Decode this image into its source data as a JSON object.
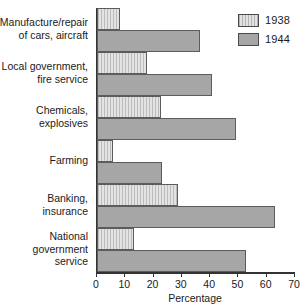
{
  "chart_data": {
    "type": "bar",
    "orientation": "horizontal",
    "title": "",
    "xlabel": "Percentage",
    "ylabel": "",
    "xlim": [
      0,
      70
    ],
    "xticks": [
      0,
      10,
      20,
      30,
      40,
      50,
      60,
      70
    ],
    "grid": false,
    "legend_position": "top-right",
    "categories": [
      "Manufacture/repair of cars, aircraft",
      "Local government, fire service",
      "Chemicals, explosives",
      "Farming",
      "Banking, insurance",
      "National government service"
    ],
    "series": [
      {
        "name": "1938",
        "color": "#e3e3e3",
        "values": [
          8,
          17.5,
          22.5,
          5.5,
          28.5,
          13
        ]
      },
      {
        "name": "1944",
        "color": "#a6a6a6",
        "values": [
          36.5,
          40.5,
          49,
          23,
          63,
          52.5
        ]
      }
    ]
  },
  "legend": {
    "items": [
      {
        "label": "1938",
        "swatch": "light-hatched-swatch"
      },
      {
        "label": "1944",
        "swatch": "dark-gray-swatch"
      }
    ]
  },
  "axis": {
    "x_title": "Percentage",
    "x_tick_labels": [
      "0",
      "10",
      "20",
      "30",
      "40",
      "50",
      "60",
      "70"
    ]
  },
  "category_labels": [
    {
      "line1": "Manufacture/repair",
      "line2": "of cars, aircraft"
    },
    {
      "line1": "Local government,",
      "line2": "fire service"
    },
    {
      "line1": "Chemicals,",
      "line2": "explosives"
    },
    {
      "line1": "Farming",
      "line2": ""
    },
    {
      "line1": "Banking,",
      "line2": "insurance"
    },
    {
      "line1": "National",
      "line2": "government",
      "line3": "service"
    }
  ]
}
